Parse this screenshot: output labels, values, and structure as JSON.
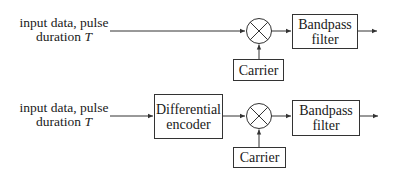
{
  "diagram": {
    "rows": [
      {
        "input_label": {
          "line1": "input data, pulse",
          "line2_prefix": "duration ",
          "line2_var": "T"
        },
        "blocks": [
          {
            "id": "multiplier",
            "symbol": "×"
          },
          {
            "id": "bandpass",
            "line1": "Bandpass",
            "line2": "filter"
          },
          {
            "id": "carrier",
            "label": "Carrier"
          }
        ]
      },
      {
        "input_label": {
          "line1": "input data, pulse",
          "line2_prefix": "duration ",
          "line2_var": "T"
        },
        "blocks": [
          {
            "id": "diff_encoder",
            "line1": "Differential",
            "line2": "encoder"
          },
          {
            "id": "multiplier",
            "symbol": "×"
          },
          {
            "id": "bandpass",
            "line1": "Bandpass",
            "line2": "filter"
          },
          {
            "id": "carrier",
            "label": "Carrier"
          }
        ]
      }
    ],
    "colors": {
      "stroke": "#333333",
      "background": "#ffffff",
      "text": "#1a1a1a"
    }
  }
}
